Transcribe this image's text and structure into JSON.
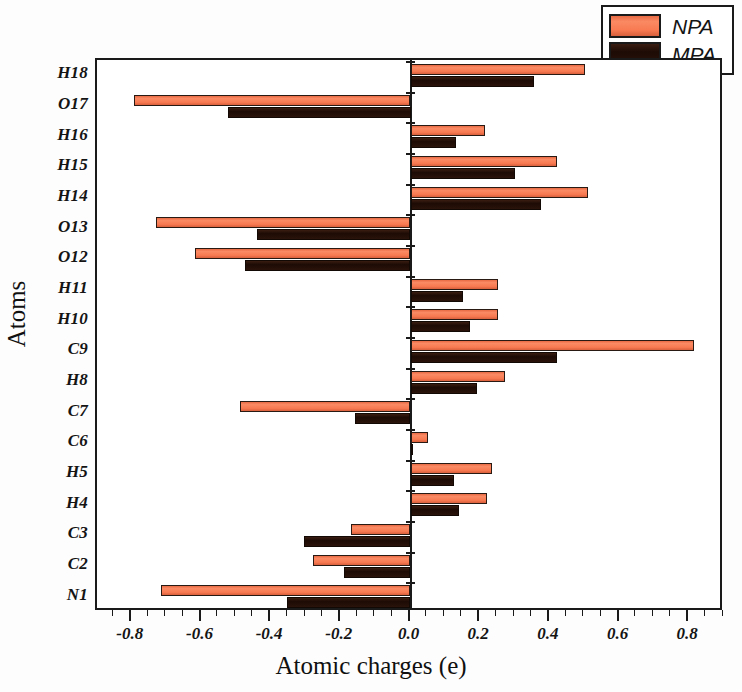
{
  "chart_data": {
    "type": "bar",
    "orientation": "horizontal",
    "title": "",
    "xlabel": "Atomic charges (e)",
    "ylabel": "Atoms",
    "xlim": [
      -0.9,
      0.9
    ],
    "xticks": [
      -0.8,
      -0.6,
      -0.4,
      -0.2,
      0.0,
      0.2,
      0.4,
      0.6,
      0.8
    ],
    "xticklabels": [
      "-0.8",
      "-0.6",
      "-0.4",
      "-0.2",
      "0.0",
      "0.2",
      "0.4",
      "0.6",
      "0.8"
    ],
    "minor_tick_step": 0.05,
    "grid": false,
    "legend_position": "top-right",
    "categories": [
      "H18",
      "O17",
      "H16",
      "H15",
      "H14",
      "O13",
      "O12",
      "H11",
      "H10",
      "C9",
      "H8",
      "C7",
      "C6",
      "H5",
      "H4",
      "C3",
      "C2",
      "N1"
    ],
    "series": [
      {
        "name": "NPA",
        "color": "#f4744a",
        "values": [
          0.5,
          -0.795,
          0.215,
          0.42,
          0.51,
          -0.73,
          -0.62,
          0.25,
          0.25,
          0.815,
          0.27,
          -0.49,
          0.05,
          0.235,
          0.22,
          -0.17,
          -0.28,
          -0.715
        ]
      },
      {
        "name": "MPA",
        "color": "#231008",
        "values": [
          0.355,
          -0.525,
          0.13,
          0.3,
          0.375,
          -0.44,
          -0.475,
          0.15,
          0.17,
          0.42,
          0.19,
          -0.16,
          0.005,
          0.125,
          0.14,
          -0.305,
          -0.19,
          -0.355
        ]
      }
    ]
  },
  "legend": {
    "items": [
      {
        "label": "NPA",
        "swatch": "npa"
      },
      {
        "label": "MPA",
        "swatch": "mpa"
      }
    ]
  }
}
